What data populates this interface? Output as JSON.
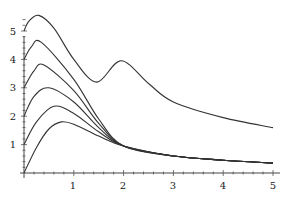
{
  "chart_data": {
    "type": "line",
    "title": "",
    "xlabel": "",
    "ylabel": "",
    "xlim": [
      0,
      5
    ],
    "ylim": [
      0,
      5.6
    ],
    "grid": false,
    "legend": null,
    "x_ticks": [
      "1",
      "2",
      "3",
      "4",
      "5"
    ],
    "y_ticks": [
      "1",
      "2",
      "3",
      "4",
      "5"
    ],
    "series": [
      {
        "name": "curve-0",
        "x": [
          0,
          0.25,
          0.5,
          0.75,
          1.0,
          1.5,
          2.0,
          3.0,
          4.0,
          5.0
        ],
        "values": [
          0,
          0.9,
          1.55,
          1.8,
          1.72,
          1.3,
          0.95,
          0.6,
          0.45,
          0.35
        ]
      },
      {
        "name": "curve-1",
        "x": [
          0,
          0.25,
          0.6,
          1.0,
          1.5,
          2.0,
          3.0,
          4.0,
          5.0
        ],
        "values": [
          1,
          1.8,
          2.35,
          2.1,
          1.45,
          0.95,
          0.6,
          0.45,
          0.35
        ]
      },
      {
        "name": "curve-2",
        "x": [
          0,
          0.2,
          0.5,
          1.0,
          1.5,
          2.0,
          3.0,
          4.0,
          5.0
        ],
        "values": [
          2,
          2.7,
          3.0,
          2.5,
          1.6,
          0.95,
          0.6,
          0.45,
          0.35
        ]
      },
      {
        "name": "curve-3",
        "x": [
          0,
          0.2,
          0.4,
          1.0,
          1.5,
          2.0,
          3.0,
          4.0,
          5.0
        ],
        "values": [
          3,
          3.6,
          3.8,
          2.9,
          1.75,
          0.95,
          0.6,
          0.45,
          0.35
        ]
      },
      {
        "name": "curve-4",
        "x": [
          0,
          0.15,
          0.35,
          1.0,
          1.5,
          2.0,
          3.0,
          4.0,
          5.0
        ],
        "values": [
          4,
          4.45,
          4.6,
          3.3,
          1.9,
          0.95,
          0.6,
          0.45,
          0.35
        ]
      },
      {
        "name": "curve-5",
        "x": [
          0,
          0.1,
          0.3,
          0.6,
          1.0,
          1.46,
          1.95,
          2.5,
          3.0,
          4.0,
          5.0
        ],
        "values": [
          5,
          5.35,
          5.55,
          5.1,
          4.0,
          3.2,
          3.95,
          3.15,
          2.5,
          1.95,
          1.6
        ]
      }
    ]
  },
  "axes": {
    "x_tick_labels": [
      "1",
      "2",
      "3",
      "4",
      "5"
    ],
    "y_tick_labels": [
      "1",
      "2",
      "3",
      "4",
      "5"
    ]
  }
}
